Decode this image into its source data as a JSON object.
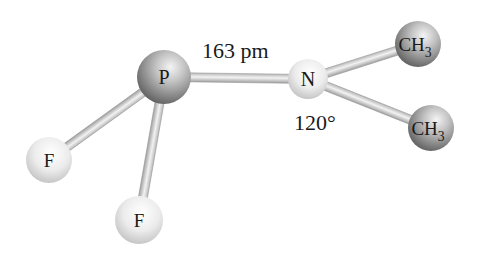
{
  "diagram": {
    "title": "",
    "molecule": "F2P-N(CH3)2",
    "atoms": [
      {
        "id": "P",
        "label": "P",
        "sub": "",
        "shade": "dark"
      },
      {
        "id": "N",
        "label": "N",
        "sub": "",
        "shade": "light"
      },
      {
        "id": "C1",
        "label": "CH",
        "sub": "3",
        "shade": "dark"
      },
      {
        "id": "C2",
        "label": "CH",
        "sub": "3",
        "shade": "dark"
      },
      {
        "id": "F1",
        "label": "F",
        "sub": "",
        "shade": "light"
      },
      {
        "id": "F2",
        "label": "F",
        "sub": "",
        "shade": "light"
      }
    ],
    "bonds": [
      {
        "from": "P",
        "to": "N"
      },
      {
        "from": "N",
        "to": "C1"
      },
      {
        "from": "N",
        "to": "C2"
      },
      {
        "from": "P",
        "to": "F1"
      },
      {
        "from": "P",
        "to": "F2"
      }
    ],
    "annotations": {
      "bond_length": "163 pm",
      "angle": "120°"
    }
  }
}
